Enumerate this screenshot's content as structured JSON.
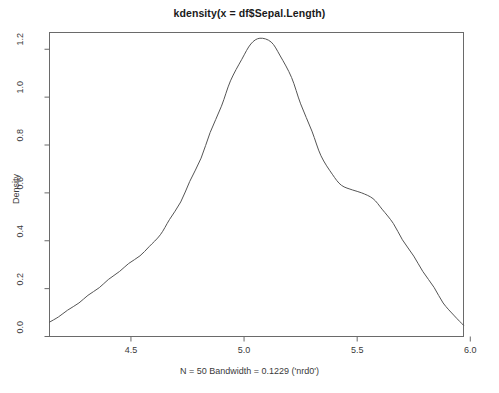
{
  "chart_data": {
    "type": "line",
    "title": "kdensity(x = df$Sepal.Length)",
    "xlabel": "N = 50   Bandwidth = 0.1229 ('nrd0')",
    "ylabel": "Density",
    "xlim": [
      4.14,
      5.97
    ],
    "ylim": [
      0.0,
      1.27
    ],
    "grid": false,
    "legend": null,
    "xticks": [
      "4.5",
      "5.0",
      "5.5",
      "6.0"
    ],
    "xtick_values": [
      4.5,
      5.0,
      5.5,
      6.0
    ],
    "yticks": [
      "0.0",
      "0.2",
      "0.4",
      "0.6",
      "0.8",
      "1.0",
      "1.2"
    ],
    "ytick_values": [
      0.0,
      0.2,
      0.4,
      0.6,
      0.8,
      1.0,
      1.2
    ],
    "line_color": "#555555",
    "series": [
      {
        "name": "Density",
        "x": [
          4.14,
          4.18,
          4.22,
          4.27,
          4.31,
          4.36,
          4.4,
          4.45,
          4.49,
          4.54,
          4.58,
          4.63,
          4.67,
          4.72,
          4.76,
          4.81,
          4.85,
          4.9,
          4.94,
          4.99,
          5.03,
          5.07,
          5.12,
          5.16,
          5.21,
          5.25,
          5.3,
          5.34,
          5.39,
          5.43,
          5.48,
          5.52,
          5.57,
          5.61,
          5.66,
          5.7,
          5.75,
          5.79,
          5.84,
          5.88,
          5.93,
          5.97
        ],
        "y": [
          0.06,
          0.082,
          0.11,
          0.14,
          0.172,
          0.204,
          0.238,
          0.272,
          0.305,
          0.337,
          0.375,
          0.425,
          0.488,
          0.562,
          0.648,
          0.745,
          0.852,
          0.962,
          1.068,
          1.158,
          1.222,
          1.246,
          1.23,
          1.172,
          1.082,
          0.972,
          0.858,
          0.755,
          0.678,
          0.632,
          0.612,
          0.6,
          0.576,
          0.532,
          0.472,
          0.404,
          0.336,
          0.272,
          0.205,
          0.14,
          0.086,
          0.047
        ]
      }
    ],
    "peak": {
      "x": 5.07,
      "y": 1.246
    },
    "n": 50,
    "bandwidth": 0.1229,
    "bw_rule": "nrd0"
  },
  "axes": {
    "box_color": "#6a6a6a",
    "tick_color": "#6a6a6a"
  }
}
